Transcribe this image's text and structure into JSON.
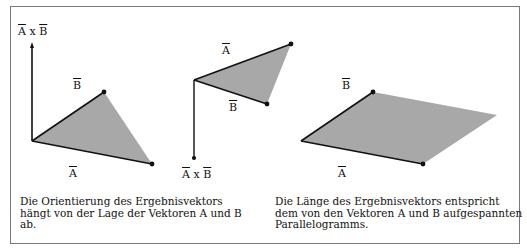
{
  "figure": {
    "left_diagram": {
      "labels": {
        "cross": "A x B",
        "cross_a": "A",
        "cross_x": "x",
        "cross_b": "B",
        "b": "B",
        "a": "A"
      },
      "caption": [
        "Die Orientierung des Ergebnisvektors",
        "hängt von der Lage der Vektoren A und B",
        "ab."
      ]
    },
    "middle_diagram": {
      "labels": {
        "a": "A",
        "b": "B",
        "cross_a": "A",
        "cross_x": "x",
        "cross_b": "B"
      }
    },
    "right_diagram": {
      "labels": {
        "b": "B",
        "a": "A"
      },
      "caption": [
        "Die Länge des Ergebnisvektors entspricht",
        "dem von den Vektoren A und B aufgespannten",
        "Parallelogramms."
      ]
    },
    "colors": {
      "fill": "#a8a8a8",
      "stroke": "#111111",
      "border": "#7a7a7a"
    }
  }
}
